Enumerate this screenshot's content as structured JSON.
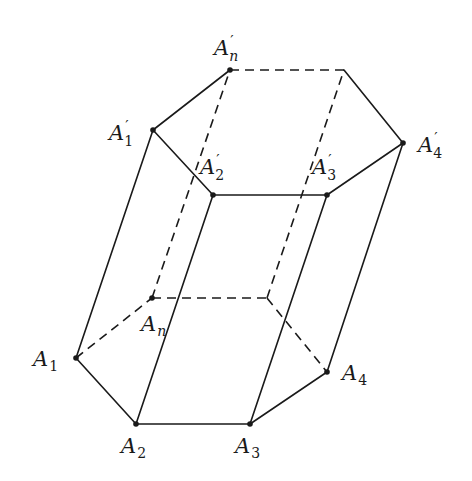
{
  "figure": {
    "bottom_base": {
      "vertices": [
        {
          "id": "A1",
          "letter": "A",
          "sub": "1",
          "prime": false,
          "x": 76,
          "y": 358
        },
        {
          "id": "A2",
          "letter": "A",
          "sub": "2",
          "prime": false,
          "x": 136,
          "y": 424
        },
        {
          "id": "A3",
          "letter": "A",
          "sub": "3",
          "prime": false,
          "x": 250,
          "y": 424
        },
        {
          "id": "A4",
          "letter": "A",
          "sub": "4",
          "prime": false,
          "x": 327,
          "y": 372
        },
        {
          "id": "B5",
          "letter": "",
          "sub": "",
          "prime": false,
          "x": 267,
          "y": 298
        },
        {
          "id": "An",
          "letter": "A",
          "sub": "n",
          "prime": false,
          "x": 152,
          "y": 298
        }
      ]
    },
    "top_base": {
      "vertices": [
        {
          "id": "A1p",
          "letter": "A",
          "sub": "1",
          "prime": true,
          "x": 153,
          "y": 130
        },
        {
          "id": "A2p",
          "letter": "A",
          "sub": "2",
          "prime": true,
          "x": 213,
          "y": 195
        },
        {
          "id": "A3p",
          "letter": "A",
          "sub": "3",
          "prime": true,
          "x": 327,
          "y": 195
        },
        {
          "id": "A4p",
          "letter": "A",
          "sub": "4",
          "prime": true,
          "x": 403,
          "y": 143
        },
        {
          "id": "T5",
          "letter": "",
          "sub": "",
          "prime": false,
          "x": 344,
          "y": 70
        },
        {
          "id": "Anp",
          "letter": "A",
          "sub": "n",
          "prime": true,
          "x": 230,
          "y": 70
        }
      ]
    },
    "labels": {
      "A1": {
        "letter": "A",
        "sub": "1"
      },
      "A2": {
        "letter": "A",
        "sub": "2"
      },
      "A3": {
        "letter": "A",
        "sub": "3"
      },
      "A4": {
        "letter": "A",
        "sub": "4"
      },
      "An": {
        "letter": "A",
        "sub": "n"
      },
      "A1p": {
        "letter": "A",
        "prime": "′",
        "sub": "1"
      },
      "A2p": {
        "letter": "A",
        "prime": "′",
        "sub": "2"
      },
      "A3p": {
        "letter": "A",
        "prime": "′",
        "sub": "3"
      },
      "A4p": {
        "letter": "A",
        "prime": "′",
        "sub": "4"
      },
      "Anp": {
        "letter": "A",
        "prime": "′",
        "sub": "n"
      }
    },
    "colors": {
      "stroke": "#1a1a1a",
      "background": "#ffffff"
    },
    "line_styles": {
      "visible": "solid",
      "hidden": "dashed"
    }
  }
}
